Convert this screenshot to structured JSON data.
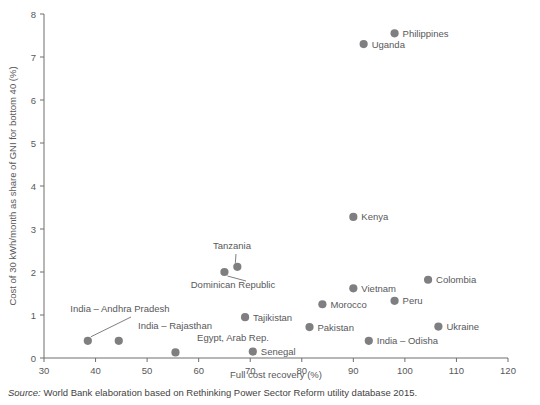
{
  "chart_data": {
    "type": "scatter",
    "title": "",
    "xlabel": "Full cost recovery (%)",
    "ylabel": "Cost of 30 kWh/month as share of GNI for bottom 40 (%)",
    "xlim": [
      30,
      120
    ],
    "ylim": [
      0,
      8
    ],
    "xticks": [
      30,
      40,
      50,
      60,
      70,
      80,
      90,
      100,
      110,
      120
    ],
    "yticks": [
      0,
      1,
      2,
      3,
      4,
      5,
      6,
      7,
      8
    ],
    "grid": false,
    "legend": "none",
    "marker_color": "#7f7f82",
    "points": [
      {
        "label": "Philippines",
        "x": 98.0,
        "y": 7.55,
        "label_pos": "right"
      },
      {
        "label": "Uganda",
        "x": 92.0,
        "y": 7.3,
        "label_pos": "right"
      },
      {
        "label": "Kenya",
        "x": 90.0,
        "y": 3.28,
        "label_pos": "right"
      },
      {
        "label": "Colombia",
        "x": 104.5,
        "y": 1.82,
        "label_pos": "right"
      },
      {
        "label": "Vietnam",
        "x": 90.0,
        "y": 1.62,
        "label_pos": "right"
      },
      {
        "label": "Peru",
        "x": 98.0,
        "y": 1.33,
        "label_pos": "right"
      },
      {
        "label": "Morocco",
        "x": 84.0,
        "y": 1.25,
        "label_pos": "right"
      },
      {
        "label": "Tanzania",
        "x": 67.5,
        "y": 2.12,
        "label_pos": "leader-up"
      },
      {
        "label": "Dominican Republic",
        "x": 65.0,
        "y": 2.0,
        "label_pos": "leader-down"
      },
      {
        "label": "Tajikistan",
        "x": 69.0,
        "y": 0.95,
        "label_pos": "right"
      },
      {
        "label": "Pakistan",
        "x": 81.5,
        "y": 0.72,
        "label_pos": "right"
      },
      {
        "label": "Ukraine",
        "x": 106.5,
        "y": 0.73,
        "label_pos": "right"
      },
      {
        "label": "India – Odisha",
        "x": 93.0,
        "y": 0.4,
        "label_pos": "right"
      },
      {
        "label": "India – Andhra Pradesh",
        "x": 38.5,
        "y": 0.4,
        "label_pos": "leader-up"
      },
      {
        "label": "India – Rajasthan",
        "x": 44.5,
        "y": 0.4,
        "label_pos": "above"
      },
      {
        "label": "Egypt, Arab Rep.",
        "x": 55.5,
        "y": 0.13,
        "label_pos": "above"
      },
      {
        "label": "Senegal",
        "x": 70.5,
        "y": 0.15,
        "label_pos": "right"
      }
    ]
  },
  "source": {
    "label": "Source:",
    "text": " World Bank elaboration based on Rethinking Power Sector Reform utility database 2015."
  }
}
